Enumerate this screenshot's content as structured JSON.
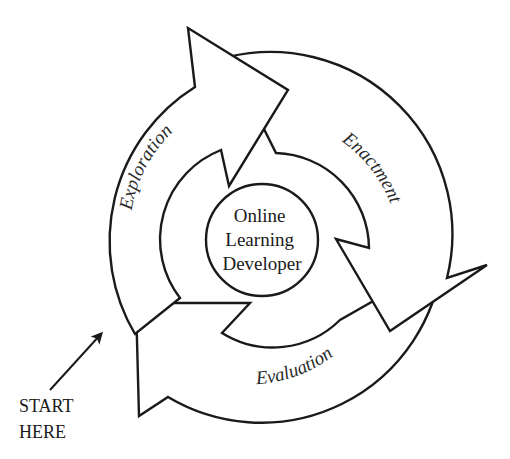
{
  "diagram": {
    "type": "cycle",
    "center": {
      "lines": [
        "Online",
        "Learning",
        "Developer"
      ]
    },
    "stages": [
      {
        "label": "Exploration",
        "order": 1
      },
      {
        "label": "Enactment",
        "order": 2
      },
      {
        "label": "Evaluation",
        "order": 3
      }
    ],
    "start": {
      "lines": [
        "START",
        "HERE"
      ]
    },
    "colors": {
      "stroke": "#1a1a1a",
      "fill": "#ffffff",
      "text": "#2a2a2a"
    }
  }
}
